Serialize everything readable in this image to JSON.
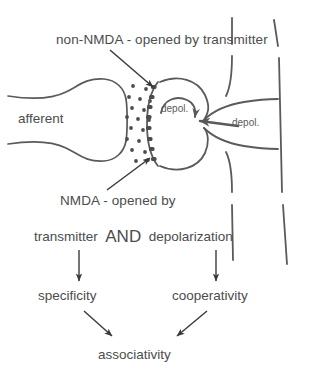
{
  "diagram": {
    "title_label": "non-NMDA - opened by transmitter",
    "afferent_label": "afferent",
    "depol_label_inner": "depol.",
    "depol_label_outer": "depol.",
    "nmda_label": "NMDA - opened by",
    "and_row": {
      "left": "transmitter",
      "operator": "AND",
      "right": "depolarization"
    },
    "outcomes": {
      "specificity": "specificity",
      "cooperativity": "cooperativity",
      "associativity": "associativity"
    },
    "colors": {
      "ink": "#4c4c4c",
      "stroke": "#5a5a5a",
      "arrow": "#3a3a3a",
      "background": "#ffffff"
    }
  }
}
